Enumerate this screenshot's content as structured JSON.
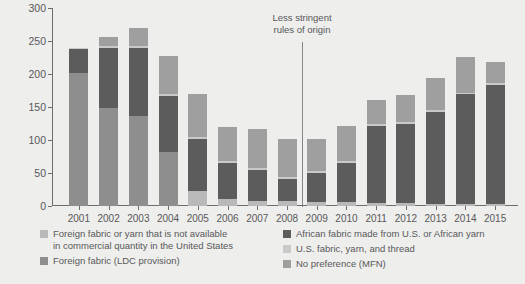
{
  "chart_data": {
    "type": "bar",
    "stacked": true,
    "title": "",
    "xlabel": "",
    "ylabel": "Apparel exports (US$, millions)",
    "ylim": [
      0,
      300
    ],
    "yticks": [
      0,
      50,
      100,
      150,
      200,
      250,
      300
    ],
    "grid": false,
    "legend_position": "bottom",
    "categories": [
      "2001",
      "2002",
      "2003",
      "2004",
      "2005",
      "2006",
      "2007",
      "2008",
      "2009",
      "2010",
      "2011",
      "2012",
      "2013",
      "2014",
      "2015"
    ],
    "series": [
      {
        "name": "Foreign fabric or yarn that is not available in commercial quantity in the United States",
        "color": "#b9b9b9",
        "values": [
          0,
          0,
          0,
          0,
          22,
          10,
          8,
          8,
          6,
          6,
          4,
          4,
          3,
          3,
          3
        ]
      },
      {
        "name": "Foreign fabric (LDC provision)",
        "color": "#8e8e8e",
        "values": [
          201,
          149,
          137,
          82,
          0,
          0,
          0,
          0,
          0,
          0,
          0,
          0,
          0,
          0,
          0
        ]
      },
      {
        "name": "African fabric made from U.S. or African yarn",
        "color": "#5c5c5c",
        "values": [
          37,
          91,
          103,
          85,
          79,
          55,
          47,
          33,
          44,
          59,
          117,
          120,
          140,
          166,
          181
        ]
      },
      {
        "name": "U.S. fabric, yarn, and thread",
        "color": "#c9c9c9",
        "values": [
          2,
          3,
          3,
          3,
          3,
          3,
          3,
          3,
          3,
          3,
          3,
          3,
          3,
          3,
          3
        ]
      },
      {
        "name": "No preference (MFN)",
        "color": "#9f9f9f",
        "values": [
          0,
          13,
          27,
          58,
          66,
          52,
          58,
          58,
          48,
          54,
          36,
          41,
          48,
          54,
          32
        ]
      }
    ],
    "totals": [
      240,
      256,
      270,
      228,
      170,
      120,
      116,
      102,
      101,
      122,
      160,
      168,
      194,
      226,
      219
    ],
    "annotation": {
      "text_line_1": "Less stringent",
      "text_line_2": "rules of origin",
      "at_category": "2008/2009 boundary"
    }
  },
  "legend": {
    "left": [
      {
        "label_line_1": "Foreign fabric or yarn that is not available",
        "label_line_2": "in commercial quantity in the United States",
        "color": "#b9b9b9",
        "name": "legend-foreign-fabric-or-yarn"
      },
      {
        "label_line_1": "Foreign fabric (LDC provision)",
        "label_line_2": "",
        "color": "#8e8e8e",
        "name": "legend-foreign-fabric-ldc"
      }
    ],
    "right": [
      {
        "label_line_1": "African fabric made from U.S. or African yarn",
        "label_line_2": "",
        "color": "#5c5c5c",
        "name": "legend-african-fabric"
      },
      {
        "label_line_1": "U.S. fabric, yarn, and thread",
        "label_line_2": "",
        "color": "#c9c9c9",
        "name": "legend-us-fabric"
      },
      {
        "label_line_1": "No preference (MFN)",
        "label_line_2": "",
        "color": "#9f9f9f",
        "name": "legend-no-preference-mfn"
      }
    ]
  },
  "colors": {
    "background": "#eeeeec",
    "axis": "#6d6d6d",
    "text": "#58585a",
    "annotation_line": "#86868a"
  }
}
